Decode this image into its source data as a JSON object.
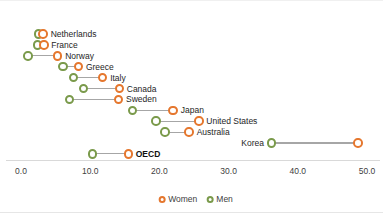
{
  "chart_data": {
    "type": "dumbbell",
    "title": "",
    "x_axis": {
      "min": 0,
      "max": 50,
      "grid": false,
      "ticks": [
        {
          "value": 0,
          "label": "0.0"
        },
        {
          "value": 10,
          "label": "10.0"
        },
        {
          "value": 20,
          "label": "20.0"
        },
        {
          "value": 30,
          "label": "30.0"
        },
        {
          "value": 40,
          "label": "40.0"
        },
        {
          "value": 50,
          "label": "50.0"
        }
      ]
    },
    "series_meta": [
      {
        "name": "Women",
        "color": "#E5772E"
      },
      {
        "name": "Men",
        "color": "#7A9A4B"
      }
    ],
    "legend": {
      "position": "bottom-center"
    },
    "colors": {
      "connector": "#A6A6A6",
      "axis_line": "#D9D9D9",
      "label_text": "#262626",
      "tick_text": "#404040"
    },
    "rows": [
      {
        "country": "Netherlands",
        "women": 3.2,
        "men": 2.5,
        "bold": false
      },
      {
        "country": "France",
        "women": 3.3,
        "men": 2.4,
        "bold": false
      },
      {
        "country": "Norway",
        "women": 5.3,
        "men": 1.0,
        "bold": false
      },
      {
        "country": "Greece",
        "women": 8.3,
        "men": 6.1,
        "bold": false
      },
      {
        "country": "Italy",
        "women": 11.8,
        "men": 7.6,
        "bold": false
      },
      {
        "country": "Canada",
        "women": 14.2,
        "men": 9.0,
        "bold": false
      },
      {
        "country": "Sweden",
        "women": 14.1,
        "men": 7.0,
        "bold": false
      },
      {
        "country": "Japan",
        "women": 22.0,
        "men": 16.1,
        "bold": false
      },
      {
        "country": "United States",
        "women": 25.7,
        "men": 19.5,
        "bold": false
      },
      {
        "country": "Australia",
        "women": 24.3,
        "men": 20.8,
        "bold": false
      },
      {
        "country": "Korea",
        "women": 48.7,
        "men": 36.2,
        "bold": false
      },
      {
        "country": "OECD",
        "women": 15.5,
        "men": 10.3,
        "bold": true
      }
    ]
  }
}
